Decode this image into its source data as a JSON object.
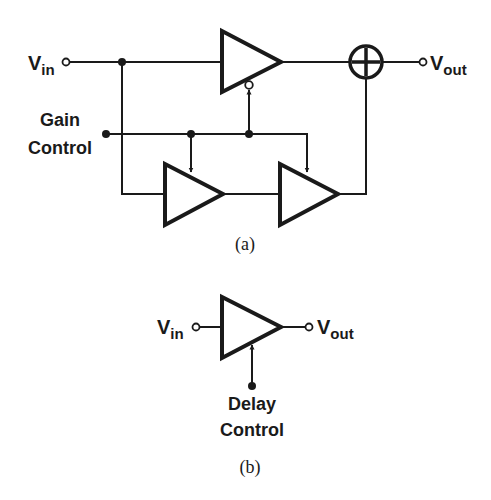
{
  "figure_a": {
    "caption": "(a)",
    "input_label": {
      "main": "V",
      "sub": "in"
    },
    "output_label": {
      "main": "V",
      "sub": "out"
    },
    "gain_control_label": [
      "Gain",
      "Control"
    ],
    "summer_symbol": "plus",
    "blocks": [
      {
        "id": "main-amp",
        "type": "amplifier",
        "control": "inverted-gain"
      },
      {
        "id": "path-amp-1",
        "type": "amplifier",
        "control": "gain"
      },
      {
        "id": "path-amp-2",
        "type": "amplifier",
        "control": "gain"
      },
      {
        "id": "summer",
        "type": "adder"
      }
    ]
  },
  "figure_b": {
    "caption": "(b)",
    "input_label": {
      "main": "V",
      "sub": "in"
    },
    "output_label": {
      "main": "V",
      "sub": "out"
    },
    "delay_control_label": [
      "Delay",
      "Control"
    ],
    "blocks": [
      {
        "id": "delay-amp",
        "type": "amplifier",
        "control": "delay"
      }
    ]
  },
  "colors": {
    "ink": "#1a1a1a",
    "background": "#ffffff"
  }
}
